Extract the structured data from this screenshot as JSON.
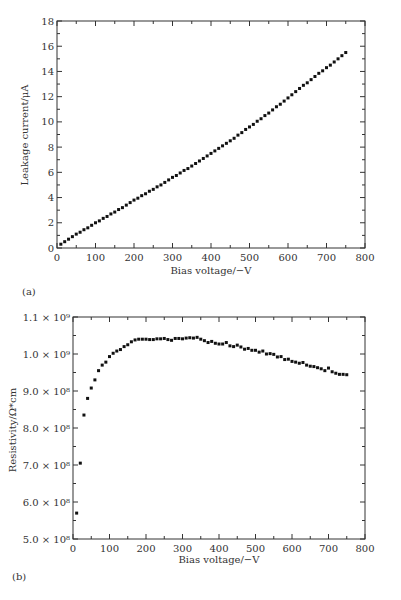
{
  "chart_data": [
    {
      "type": "scatter",
      "panel_label": "(a)",
      "title": "",
      "xlabel": "Bias voltage/−V",
      "ylabel": "Leakage current/μA",
      "xlim": [
        0,
        800
      ],
      "ylim": [
        0,
        18
      ],
      "x_ticks": [
        0,
        100,
        200,
        300,
        400,
        500,
        600,
        700,
        800
      ],
      "y_ticks": [
        0,
        2,
        4,
        6,
        8,
        10,
        12,
        14,
        16,
        18
      ],
      "grid": false,
      "legend": null,
      "series": [
        {
          "name": "Leakage current",
          "x": [
            10,
            20,
            30,
            40,
            50,
            60,
            70,
            80,
            90,
            100,
            110,
            120,
            130,
            140,
            150,
            160,
            170,
            180,
            190,
            200,
            210,
            220,
            230,
            240,
            250,
            260,
            270,
            280,
            290,
            300,
            310,
            320,
            330,
            340,
            350,
            360,
            370,
            380,
            390,
            400,
            410,
            420,
            430,
            440,
            450,
            460,
            470,
            480,
            490,
            500,
            510,
            520,
            530,
            540,
            550,
            560,
            570,
            580,
            590,
            600,
            610,
            620,
            630,
            640,
            650,
            660,
            670,
            680,
            690,
            700,
            710,
            720,
            730,
            740,
            750
          ],
          "y": [
            0.3,
            0.5,
            0.7,
            0.9,
            1.1,
            1.25,
            1.45,
            1.6,
            1.8,
            2.0,
            2.15,
            2.35,
            2.5,
            2.7,
            2.85,
            3.05,
            3.2,
            3.4,
            3.6,
            3.8,
            3.95,
            4.15,
            4.3,
            4.5,
            4.65,
            4.85,
            5.0,
            5.2,
            5.4,
            5.6,
            5.75,
            5.95,
            6.15,
            6.3,
            6.5,
            6.7,
            6.9,
            7.1,
            7.3,
            7.5,
            7.7,
            7.9,
            8.1,
            8.3,
            8.5,
            8.7,
            8.95,
            9.15,
            9.4,
            9.6,
            9.8,
            10.05,
            10.25,
            10.5,
            10.7,
            10.95,
            11.2,
            11.4,
            11.65,
            11.9,
            12.15,
            12.4,
            12.65,
            12.9,
            13.1,
            13.35,
            13.6,
            13.85,
            14.05,
            14.3,
            14.5,
            14.75,
            15.0,
            15.25,
            15.5
          ]
        }
      ]
    },
    {
      "type": "scatter",
      "panel_label": "(b)",
      "title": "",
      "xlabel": "Bias voltage/−V",
      "ylabel": "Resistivity/Ω*cm",
      "xlim": [
        0,
        800
      ],
      "ylim": [
        500000000.0,
        1100000000.0
      ],
      "x_ticks": [
        0,
        100,
        200,
        300,
        400,
        500,
        600,
        700,
        800
      ],
      "y_ticks": [
        500000000.0,
        600000000.0,
        700000000.0,
        800000000.0,
        900000000.0,
        1000000000.0,
        1100000000.0
      ],
      "y_tick_labels": [
        "5.0 × 10⁸",
        "6.0 × 10⁸",
        "7.0 × 10⁸",
        "8.0 × 10⁸",
        "9.0 × 10⁸",
        "1.0 × 10⁹",
        "1.1 × 10⁹"
      ],
      "grid": false,
      "legend": null,
      "series": [
        {
          "name": "Resistivity",
          "x": [
            10,
            20,
            30,
            40,
            50,
            60,
            70,
            80,
            90,
            100,
            110,
            120,
            130,
            140,
            150,
            160,
            170,
            180,
            190,
            200,
            210,
            220,
            230,
            240,
            250,
            260,
            270,
            280,
            290,
            300,
            310,
            320,
            330,
            340,
            350,
            360,
            370,
            380,
            390,
            400,
            410,
            420,
            430,
            440,
            450,
            460,
            470,
            480,
            490,
            500,
            510,
            520,
            530,
            540,
            550,
            560,
            570,
            580,
            590,
            600,
            610,
            620,
            630,
            640,
            650,
            660,
            670,
            680,
            690,
            700,
            710,
            720,
            730,
            740,
            750
          ],
          "y": [
            570000000.0,
            705000000.0,
            835000000.0,
            880000000.0,
            908000000.0,
            930000000.0,
            955000000.0,
            970000000.0,
            978000000.0,
            993000000.0,
            1002000000.0,
            1008000000.0,
            1012000000.0,
            1020000000.0,
            1025000000.0,
            1033000000.0,
            1038000000.0,
            1040000000.0,
            1040000000.0,
            1040000000.0,
            1039000000.0,
            1039000000.0,
            1041000000.0,
            1041000000.0,
            1042000000.0,
            1039000000.0,
            1037000000.0,
            1042000000.0,
            1042000000.0,
            1041000000.0,
            1043000000.0,
            1044000000.0,
            1043000000.0,
            1045000000.0,
            1040000000.0,
            1036000000.0,
            1031000000.0,
            1034000000.0,
            1029000000.0,
            1027000000.0,
            1027000000.0,
            1031000000.0,
            1022000000.0,
            1020000000.0,
            1024000000.0,
            1019000000.0,
            1013000000.0,
            1015000000.0,
            1010000000.0,
            1010000000.0,
            1005000000.0,
            1008000000.0,
            1000000000.0,
            1001000000.0,
            999000000.0,
            992000000.0,
            993000000.0,
            985000000.0,
            986000000.0,
            980000000.0,
            978000000.0,
            975000000.0,
            977000000.0,
            970000000.0,
            967000000.0,
            966000000.0,
            963000000.0,
            960000000.0,
            955000000.0,
            962000000.0,
            952000000.0,
            948000000.0,
            945000000.0,
            945000000.0,
            944000000.0
          ]
        }
      ]
    }
  ],
  "panels": {
    "a": {
      "label": "(a)",
      "xlabel": "Bias voltage/−V",
      "ylabel": "Leakage current/μA",
      "x_tick_labels": [
        "0",
        "100",
        "200",
        "300",
        "400",
        "500",
        "600",
        "700",
        "800"
      ],
      "y_tick_labels": [
        "0",
        "2",
        "4",
        "6",
        "8",
        "10",
        "12",
        "14",
        "16",
        "18"
      ]
    },
    "b": {
      "label": "(b)",
      "xlabel": "Bias voltage/−V",
      "ylabel": "Resistivity/Ω*cm",
      "x_tick_labels": [
        "0",
        "100",
        "200",
        "300",
        "400",
        "500",
        "600",
        "700",
        "800"
      ],
      "y_tick_labels": [
        "5.0 × 10⁸",
        "6.0 × 10⁸",
        "7.0 × 10⁸",
        "8.0 × 10⁸",
        "9.0 × 10⁸",
        "1.0 × 10⁹",
        "1.1 × 10⁹"
      ]
    }
  }
}
